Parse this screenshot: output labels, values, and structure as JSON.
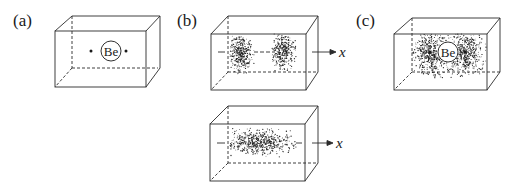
{
  "panels": [
    {
      "id": "a",
      "label": "(a)",
      "atom_label": "Be",
      "description": "Be atom with two electrons (dots) inside a box"
    },
    {
      "id": "b_top",
      "label": "(b)",
      "axis_label": "x",
      "description": "Two separated electron density clouds along x axis"
    },
    {
      "id": "b_bottom",
      "axis_label": "x",
      "description": "Single elongated electron density cloud along x axis"
    },
    {
      "id": "c",
      "label": "(c)",
      "atom_label": "Be",
      "description": "Be atom with two electrons and surrounding density clouds"
    }
  ],
  "colors": {
    "line": "#2a2a2a",
    "dots": "#1a1a1a",
    "background": "#ffffff"
  }
}
